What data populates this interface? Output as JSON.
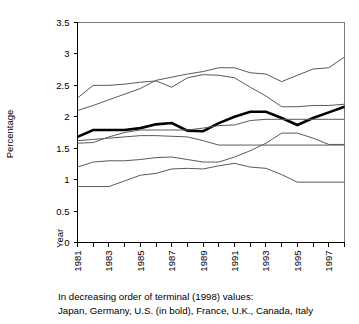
{
  "figure": {
    "y_axis_title": "Percentage",
    "x_axis_corner_label": "Year",
    "caption_line1": "In decreasing order of terminal (1998) values:",
    "caption_line2": "Japan, Germany, U.S. (in bold), France, U.K., Canada, Italy"
  },
  "chart_data": {
    "type": "line",
    "title": "",
    "subtitle": "",
    "xlabel": "Year",
    "ylabel": "Percentage",
    "xlim": [
      1981,
      1998
    ],
    "ylim": [
      0,
      3.5
    ],
    "ytick_values": [
      0,
      0.5,
      1,
      1.5,
      2,
      2.5,
      3,
      3.5
    ],
    "ytick_labels": [
      "0",
      "0.5",
      "1",
      "1.5",
      "2",
      "2.5",
      "3",
      "3.5"
    ],
    "x": [
      1981,
      1982,
      1983,
      1984,
      1985,
      1986,
      1987,
      1988,
      1989,
      1990,
      1991,
      1992,
      1993,
      1994,
      1995,
      1996,
      1997,
      1998
    ],
    "xtick_values": [
      1981,
      1982,
      1983,
      1984,
      1985,
      1986,
      1987,
      1988,
      1989,
      1990,
      1991,
      1992,
      1993,
      1994,
      1995,
      1996,
      1997,
      1998
    ],
    "xtick_labels": [
      "1981",
      "",
      "1983",
      "",
      "1985",
      "",
      "1987",
      "",
      "1989",
      "",
      "1991",
      "",
      "1993",
      "",
      "1995",
      "",
      "1997",
      ""
    ],
    "grid": false,
    "legend": "none",
    "legend_note": "Series identified in caption, in decreasing order of 1998 terminal value",
    "series": [
      {
        "name": "Japan",
        "emphasis": "normal",
        "values": [
          2.1,
          2.18,
          2.27,
          2.36,
          2.45,
          2.58,
          2.63,
          2.68,
          2.72,
          2.78,
          2.78,
          2.7,
          2.68,
          2.56,
          2.66,
          2.76,
          2.78,
          2.95
        ]
      },
      {
        "name": "Germany",
        "emphasis": "normal",
        "values": [
          2.3,
          2.5,
          2.5,
          2.52,
          2.55,
          2.57,
          2.47,
          2.62,
          2.67,
          2.66,
          2.62,
          2.47,
          2.33,
          2.16,
          2.16,
          2.18,
          2.18,
          2.2
        ]
      },
      {
        "name": "U.S.",
        "emphasis": "bold",
        "values": [
          1.68,
          1.79,
          1.79,
          1.79,
          1.82,
          1.88,
          1.9,
          1.78,
          1.77,
          1.9,
          2.0,
          2.08,
          2.08,
          1.98,
          1.87,
          1.98,
          2.07,
          2.16
        ]
      },
      {
        "name": "France",
        "emphasis": "normal",
        "values": [
          1.58,
          1.59,
          1.68,
          1.75,
          1.79,
          1.79,
          1.79,
          1.79,
          1.82,
          1.86,
          1.87,
          1.94,
          1.96,
          1.96,
          1.96,
          1.96,
          1.96,
          1.96
        ]
      },
      {
        "name": "U.K.",
        "emphasis": "normal",
        "values": [
          1.62,
          1.64,
          1.66,
          1.68,
          1.7,
          1.7,
          1.69,
          1.68,
          1.62,
          1.55,
          1.55,
          1.55,
          1.55,
          1.55,
          1.55,
          1.55,
          1.55,
          1.55
        ]
      },
      {
        "name": "Canada",
        "emphasis": "normal",
        "values": [
          1.2,
          1.28,
          1.3,
          1.3,
          1.32,
          1.35,
          1.36,
          1.32,
          1.28,
          1.28,
          1.36,
          1.46,
          1.58,
          1.74,
          1.74,
          1.66,
          1.56,
          1.56
        ]
      },
      {
        "name": "Italy",
        "emphasis": "normal",
        "values": [
          0.89,
          0.89,
          0.89,
          0.98,
          1.07,
          1.1,
          1.17,
          1.18,
          1.17,
          1.22,
          1.26,
          1.2,
          1.18,
          1.08,
          0.96,
          0.96,
          0.96,
          0.96
        ]
      }
    ]
  }
}
